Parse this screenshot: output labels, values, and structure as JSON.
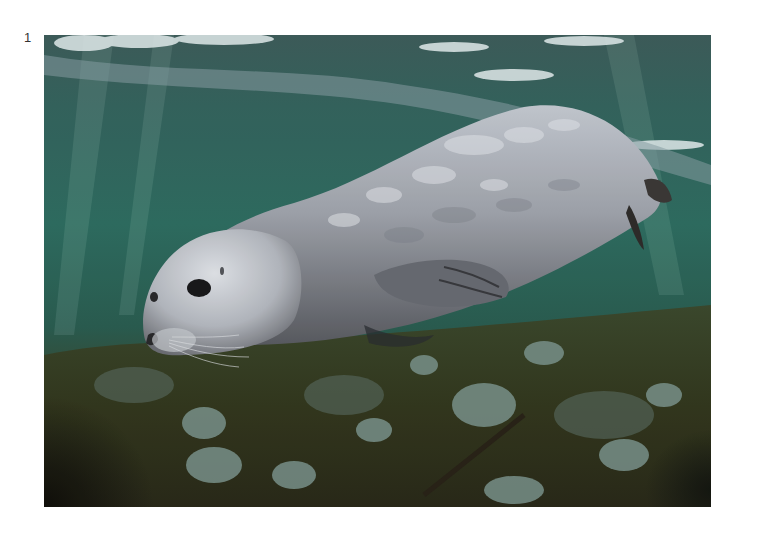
{
  "page": {
    "figure_number": "1"
  },
  "photo": {
    "subject": "harbour seal swimming underwater over rocky seabed",
    "colors": {
      "water_top": "#3c6b66",
      "water_mid": "#2e6a5e",
      "water_deep": "#28584e",
      "surface_light": "#e8f0f0",
      "seal_body": "#a9aeb6",
      "seal_highlight": "#dfe3e8",
      "seal_shadow": "#5d6068",
      "seabed": "#3a3a22",
      "rocks": "#7f9a90",
      "dark_corner": "#141410"
    }
  }
}
